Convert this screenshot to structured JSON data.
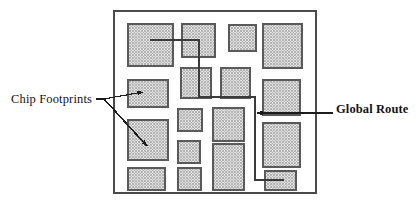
{
  "figure": {
    "background_color": "#ffffff",
    "board": {
      "name": "board-outline",
      "x": 114,
      "y": 11,
      "width": 202,
      "height": 182,
      "stroke_color": "#4a4a4a",
      "stroke_width": 1.2,
      "fill_color": "#ffffff"
    },
    "chip_style": {
      "fill_color": "#cfcfcf",
      "stroke_color": "#5a5a5a",
      "stroke_width": 1.1,
      "pattern": "stipple-dither"
    },
    "route_style": {
      "stroke_color": "#3a3a3a",
      "stroke_width": 1.4,
      "style": "orthogonal-manhattan"
    },
    "leader_style": {
      "stroke_color": "#1c1c1c",
      "stroke_width": 1.1
    }
  },
  "labels": {
    "chip_footprints": "Chip Footprints",
    "global_route": "Global Route"
  },
  "chips": [
    {
      "id": "chip-1",
      "x": 128,
      "y": 24,
      "width": 45,
      "height": 42
    },
    {
      "id": "chip-2",
      "x": 182,
      "y": 24,
      "width": 33,
      "height": 33
    },
    {
      "id": "chip-3",
      "x": 229,
      "y": 25,
      "width": 27,
      "height": 26
    },
    {
      "id": "chip-4",
      "x": 263,
      "y": 24,
      "width": 39,
      "height": 44
    },
    {
      "id": "chip-5",
      "x": 128,
      "y": 80,
      "width": 40,
      "height": 27
    },
    {
      "id": "chip-6",
      "x": 181,
      "y": 68,
      "width": 30,
      "height": 30
    },
    {
      "id": "chip-7",
      "x": 221,
      "y": 68,
      "width": 29,
      "height": 30
    },
    {
      "id": "chip-8",
      "x": 263,
      "y": 80,
      "width": 37,
      "height": 35
    },
    {
      "id": "chip-9",
      "x": 128,
      "y": 120,
      "width": 40,
      "height": 40
    },
    {
      "id": "chip-10",
      "x": 178,
      "y": 109,
      "width": 24,
      "height": 22
    },
    {
      "id": "chip-11",
      "x": 213,
      "y": 108,
      "width": 31,
      "height": 33
    },
    {
      "id": "chip-12",
      "x": 178,
      "y": 141,
      "width": 22,
      "height": 22
    },
    {
      "id": "chip-13",
      "x": 263,
      "y": 123,
      "width": 37,
      "height": 44
    },
    {
      "id": "chip-14",
      "x": 128,
      "y": 168,
      "width": 37,
      "height": 22
    },
    {
      "id": "chip-15",
      "x": 178,
      "y": 168,
      "width": 23,
      "height": 22
    },
    {
      "id": "chip-16",
      "x": 213,
      "y": 144,
      "width": 31,
      "height": 46
    },
    {
      "id": "chip-17",
      "x": 265,
      "y": 171,
      "width": 31,
      "height": 19
    }
  ],
  "global_route": {
    "name": "global-route-path",
    "points": [
      [
        150,
        40
      ],
      [
        199,
        40
      ],
      [
        199,
        71
      ],
      [
        199,
        97
      ],
      [
        255,
        97
      ],
      [
        255,
        116
      ],
      [
        255,
        180
      ],
      [
        284,
        180
      ]
    ],
    "start_chip": "chip-1",
    "end_chip": "chip-17"
  },
  "leaders": {
    "chip_footprints": {
      "name": "chip-footprints-leader",
      "junction": [
        104,
        99
      ],
      "branches": [
        {
          "name": "leader-branch-upper",
          "to": [
            143,
            92
          ],
          "arrow": true
        },
        {
          "name": "leader-branch-lower",
          "to": [
            147,
            146
          ],
          "arrow": true
        }
      ],
      "stem": [
        [
          96,
          99
        ],
        [
          104,
          99
        ]
      ]
    },
    "global_route": {
      "name": "global-route-leader",
      "from": [
        333,
        113
      ],
      "to": [
        257,
        113
      ],
      "arrow": true
    }
  }
}
